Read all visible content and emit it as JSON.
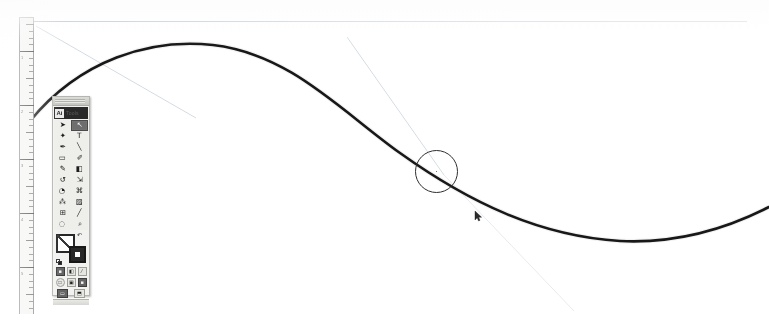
{
  "app": {
    "title": "Illustration drawing application canvas",
    "document_background": "#ffffff",
    "stroke_color": "#1a1a1a",
    "guide_color": "#b9c4ce",
    "palette_background": "#f0f0ee"
  },
  "ruler": {
    "name": "vertical-ruler",
    "orientation": "vertical",
    "unit": "inches",
    "labels": [
      "1",
      "2",
      "3",
      "4",
      "5"
    ],
    "major_positions_px": [
      30,
      84,
      138,
      192,
      246
    ],
    "tick_spacing_px": 6.75
  },
  "guides": {
    "horizontal_top": {
      "label": "horizontal-guide",
      "y": 21
    },
    "diagonal_upper_left": {
      "label": "diagonal-guide-left"
    },
    "diagonal_lower_right": {
      "label": "diagonal-guide-right"
    }
  },
  "palette": {
    "title": "Ai",
    "title_word": "Tools",
    "selected_tool": "direct-selection",
    "tools": [
      {
        "name": "selection-tool",
        "label": "Selection",
        "glyph": "➤",
        "selected": false
      },
      {
        "name": "direct-selection-tool",
        "label": "Direct Selection",
        "glyph": "↖",
        "selected": true
      },
      {
        "name": "magic-wand-tool",
        "label": "Magic Wand",
        "glyph": "✦",
        "selected": false
      },
      {
        "name": "type-tool",
        "label": "Type",
        "glyph": "T",
        "selected": false
      },
      {
        "name": "pen-tool",
        "label": "Pen",
        "glyph": "✒",
        "selected": false
      },
      {
        "name": "line-segment-tool",
        "label": "Line Segment",
        "glyph": "╲",
        "selected": false
      },
      {
        "name": "rectangle-tool",
        "label": "Rectangle",
        "glyph": "▭",
        "selected": false
      },
      {
        "name": "paintbrush-tool",
        "label": "Paintbrush",
        "glyph": "✐",
        "selected": false
      },
      {
        "name": "pencil-tool",
        "label": "Pencil",
        "glyph": "✎",
        "selected": false
      },
      {
        "name": "eraser-tool",
        "label": "Eraser",
        "glyph": "◧",
        "selected": false
      },
      {
        "name": "rotate-tool",
        "label": "Rotate",
        "glyph": "↺",
        "selected": false
      },
      {
        "name": "scale-tool",
        "label": "Scale",
        "glyph": "⇲",
        "selected": false
      },
      {
        "name": "warp-tool",
        "label": "Warp",
        "glyph": "◔",
        "selected": false
      },
      {
        "name": "free-transform-tool",
        "label": "Free Transform",
        "glyph": "⌘",
        "selected": false
      },
      {
        "name": "symbol-sprayer-tool",
        "label": "Symbol Sprayer",
        "glyph": "⁂",
        "selected": false
      },
      {
        "name": "gradient-tool",
        "label": "Gradient",
        "glyph": "▨",
        "selected": false
      },
      {
        "name": "mesh-tool",
        "label": "Mesh",
        "glyph": "⊞",
        "selected": false
      },
      {
        "name": "eyedropper-tool",
        "label": "Eyedropper",
        "glyph": "╱",
        "selected": false
      },
      {
        "name": "blend-tool",
        "label": "Blend",
        "glyph": "◌",
        "selected": false
      },
      {
        "name": "zoom-tool",
        "label": "Zoom",
        "glyph": "⌕",
        "selected": false
      }
    ],
    "color_controls": {
      "fill": {
        "name": "fill-swatch",
        "value": "#ffffff",
        "label": "Fill: None"
      },
      "stroke": {
        "name": "stroke-swatch",
        "value": "#1d1d1d",
        "label": "Stroke: Black"
      },
      "swap": "swap-fill-stroke-icon",
      "defaults": "default-fill-stroke-icon"
    },
    "paint_row": [
      {
        "name": "color-button",
        "glyph": "■",
        "active": true
      },
      {
        "name": "gradient-button",
        "glyph": "◧",
        "active": false
      },
      {
        "name": "none-button",
        "glyph": "⁄",
        "active": false
      }
    ],
    "draw_mode_row": [
      {
        "name": "draw-normal-button",
        "glyph": "□",
        "active": false
      },
      {
        "name": "draw-behind-button",
        "glyph": "▣",
        "active": false
      },
      {
        "name": "draw-inside-button",
        "glyph": "■",
        "active": true
      }
    ],
    "screen_mode_row": [
      {
        "name": "screen-mode-normal-button",
        "glyph": "▭",
        "active": true
      },
      {
        "name": "screen-mode-full-button",
        "glyph": "⬒",
        "active": false
      }
    ]
  },
  "artwork": {
    "path_name": "s-curve-path",
    "stroke_width": "2.4",
    "description": "Smooth S-shaped bezier curve spanning the canvas"
  },
  "cursors": {
    "brush_circle": {
      "name": "brush-cursor",
      "diameter_px": 43,
      "x": 415,
      "y": 150
    },
    "pen_pointer": {
      "name": "pen-cursor",
      "x": 474,
      "y": 211
    }
  }
}
